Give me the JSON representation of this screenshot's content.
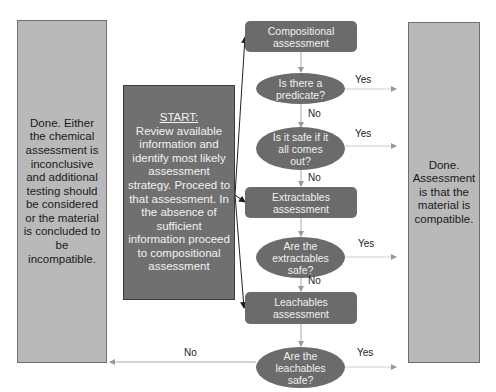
{
  "diagram": {
    "left_outcome": {
      "text": "Done. Either the chemical assessment is inconclusive and additional testing should be considered or the material is concluded to be incompatible."
    },
    "right_outcome": {
      "text": "Done. Assessment is that the material is compatible."
    },
    "start": {
      "title": "START:",
      "text": "Review available information and identify most likely assessment strategy. Proceed to that assessment. In the absence of sufficient information proceed to compositional assessment"
    },
    "nodes": {
      "compositional": "Compositional assessment",
      "q_predicate": "Is there a predicate?",
      "q_all_out": "Is it safe if it all comes out?",
      "extractables": "Extractables assessment",
      "q_extractables": "Are the extractables safe?",
      "leachables": "Leachables assessment",
      "q_leachables": "Are the leachables safe?"
    },
    "edge_labels": {
      "yes1": "Yes",
      "yes2": "Yes",
      "yes3": "Yes",
      "yes4": "Yes",
      "no1": "No",
      "no2": "No",
      "no3": "No",
      "no_final": "No"
    },
    "colors": {
      "outcome_fill": "#b9b9b9",
      "start_fill": "#707070",
      "node_fill": "#6b6b6b",
      "connector": "#a8a8a8",
      "start_arrow": "#222222"
    }
  }
}
